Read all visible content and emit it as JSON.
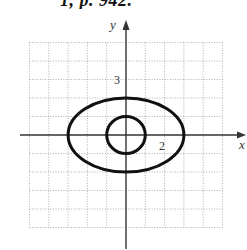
{
  "caption": {
    "text": "1, p. 942."
  },
  "axes": {
    "x_label": "x",
    "y_label": "y",
    "tick_labels": [
      {
        "axis": "y",
        "value": 3,
        "text": "3"
      },
      {
        "axis": "x",
        "value": 2,
        "text": "2"
      }
    ]
  },
  "grid": {
    "xmin": -5,
    "xmax": 5,
    "ymin": -5,
    "ymax": 5,
    "step": 1,
    "style": "dotted"
  },
  "curves": [
    {
      "name": "ellipse",
      "equation": "x^2/9 + y^2/4 = 1",
      "cx": 0,
      "cy": 0,
      "rx": 3,
      "ry": 2
    },
    {
      "name": "circle",
      "equation": "x^2 + y^2 = 1",
      "cx": 0,
      "cy": 0,
      "rx": 1,
      "ry": 1
    }
  ],
  "colors": {
    "curve": "#111111",
    "axis": "#333333",
    "grid": "#9a9a9a"
  }
}
